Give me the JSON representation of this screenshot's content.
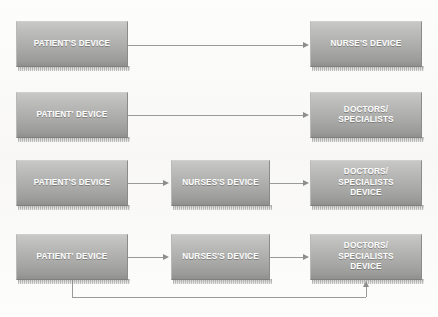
{
  "diagram": {
    "background_color": "#fdfdfc",
    "node_fill_top": "#c8c8c6",
    "node_fill_bottom": "#8f8f8d",
    "node_text_color": "#ffffff",
    "connector_color": "#9a9a98"
  },
  "rows": [
    {
      "id": "row-1",
      "nodes": [
        {
          "id": "r1-patient",
          "label": "PATIENT'S DEVICE"
        },
        {
          "id": "r1-nurse",
          "label": "NURSE'S DEVICE"
        }
      ],
      "connectors": [
        {
          "id": "r1-arrow-1",
          "from": "r1-patient",
          "to": "r1-nurse",
          "type": "arrow-right"
        }
      ]
    },
    {
      "id": "row-2",
      "nodes": [
        {
          "id": "r2-patient",
          "label": "PATIENT' DEVICE"
        },
        {
          "id": "r2-doctors",
          "label": "DOCTORS/\nSPECIALISTS"
        }
      ],
      "connectors": [
        {
          "id": "r2-arrow-1",
          "from": "r2-patient",
          "to": "r2-doctors",
          "type": "arrow-right"
        }
      ]
    },
    {
      "id": "row-3",
      "nodes": [
        {
          "id": "r3-patient",
          "label": "PATIENT'S DEVICE"
        },
        {
          "id": "r3-nurse",
          "label": "NURSES'S DEVICE"
        },
        {
          "id": "r3-doctors",
          "label": "DOCTORS/\nSPECIALISTS\nDEVICE"
        }
      ],
      "connectors": [
        {
          "id": "r3-arrow-1",
          "from": "r3-patient",
          "to": "r3-nurse",
          "type": "arrow-right"
        },
        {
          "id": "r3-arrow-2",
          "from": "r3-nurse",
          "to": "r3-doctors",
          "type": "arrow-right"
        }
      ]
    },
    {
      "id": "row-4",
      "nodes": [
        {
          "id": "r4-patient",
          "label": "PATIENT' DEVICE"
        },
        {
          "id": "r4-nurse",
          "label": "NURSES'S DEVICE"
        },
        {
          "id": "r4-doctors",
          "label": "DOCTORS/\nSPECIALISTS\nDEVICE"
        }
      ],
      "connectors": [
        {
          "id": "r4-arrow-1",
          "from": "r4-patient",
          "to": "r4-nurse",
          "type": "arrow-right"
        },
        {
          "id": "r4-arrow-2",
          "from": "r4-nurse",
          "to": "r4-doctors",
          "type": "arrow-right"
        },
        {
          "id": "r4-feedback",
          "from": "r4-patient",
          "to": "r4-doctors",
          "type": "elbow-arrow-up"
        }
      ]
    }
  ]
}
